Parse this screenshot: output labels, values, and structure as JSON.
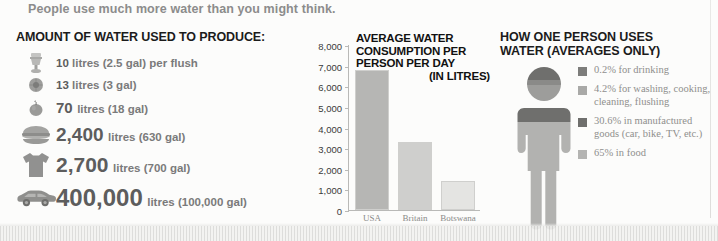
{
  "banner": {
    "text": "People use much more water than you might think."
  },
  "production": {
    "heading": "AMOUNT OF WATER USED TO PRODUCE:",
    "items": [
      {
        "icon": "toilet-icon",
        "number": "10",
        "unit": "litres (2.5 gal) per flush"
      },
      {
        "icon": "egg-icon",
        "number": "13",
        "unit": "litres (3 gal)"
      },
      {
        "icon": "apple-icon",
        "number": "70",
        "unit": "litres (18 gal)"
      },
      {
        "icon": "hamburger-icon",
        "number": "2,400",
        "unit": "litres (630 gal)"
      },
      {
        "icon": "tshirt-icon",
        "number": "2,700",
        "unit": "litres (700 gal)"
      },
      {
        "icon": "car-icon",
        "number": "400,000",
        "unit": "litres (100,000 gal)"
      }
    ]
  },
  "consumption": {
    "title_line1": "AVERAGE WATER",
    "title_line2": "CONSUMPTION PER",
    "title_line3": "PERSON PER DAY",
    "title_line4": "(IN LITRES)"
  },
  "usage": {
    "heading_line1": "HOW ONE PERSON USES",
    "heading_line2": "WATER (AVERAGES ONLY)",
    "legend": [
      {
        "color": "#7d7d7b",
        "text": "0.2% for drinking"
      },
      {
        "color": "#a9a9a7",
        "text": "4.2% for washing, cooking, cleaning, flushing"
      },
      {
        "color": "#6f6f6d",
        "text": "30.6% in manufactured goods (car, bike, TV, etc.)"
      },
      {
        "color": "#b4b4b2",
        "text": "65% in food"
      }
    ]
  },
  "chart_data": {
    "type": "bar",
    "title": "AVERAGE WATER CONSUMPTION PER PERSON PER DAY (IN LITRES)",
    "xlabel": "",
    "ylabel": "",
    "categories": [
      "USA",
      "Britain",
      "Botswana"
    ],
    "values": [
      6800,
      3300,
      1400
    ],
    "colors": [
      "#b6b6b4",
      "#cfcfcd",
      "#e4e4e2"
    ],
    "ylim": [
      0,
      8000
    ],
    "yticks": [
      0,
      1000,
      2000,
      3000,
      4000,
      5000,
      6000,
      7000,
      8000
    ],
    "ytick_labels": [
      "0",
      "1,000",
      "2,000",
      "3,000",
      "4,000",
      "5,000",
      "6,000",
      "7,000",
      "8,000"
    ],
    "grid": false,
    "legend_position": "none"
  }
}
